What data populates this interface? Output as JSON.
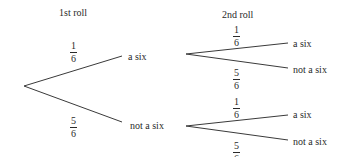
{
  "diagram": {
    "type": "probability tree",
    "headers": {
      "first": "1st roll",
      "second": "2nd roll"
    },
    "first_roll": [
      {
        "outcome": "a six",
        "probability": {
          "num": "1",
          "den": "6"
        }
      },
      {
        "outcome": "not a six",
        "probability": {
          "num": "5",
          "den": "6"
        }
      }
    ],
    "second_roll": {
      "after_six": [
        {
          "outcome": "a six",
          "probability": {
            "num": "1",
            "den": "6"
          }
        },
        {
          "outcome": "not a six",
          "probability": {
            "num": "5",
            "den": "6"
          }
        }
      ],
      "after_not_six": [
        {
          "outcome": "a six",
          "probability": {
            "num": "1",
            "den": "6"
          }
        },
        {
          "outcome": "not a six",
          "probability": {
            "num": "5",
            "den": "6"
          }
        }
      ]
    }
  }
}
